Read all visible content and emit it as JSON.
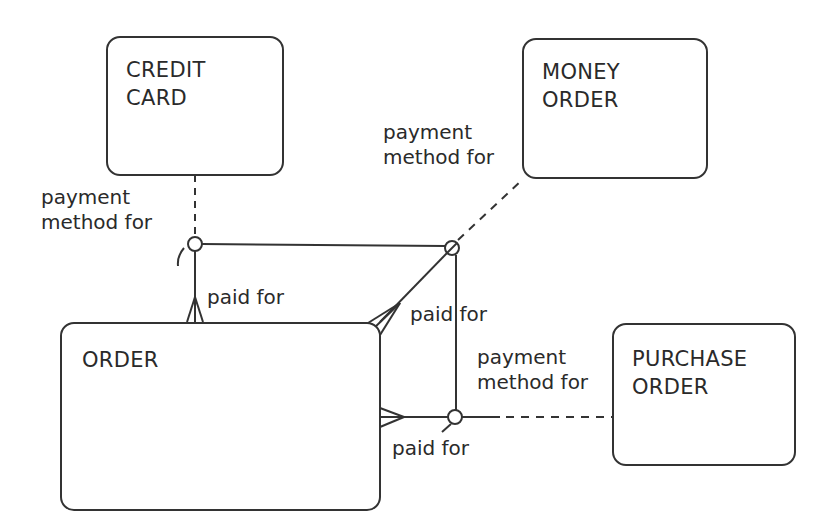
{
  "diagram": {
    "type": "entity-relationship",
    "entities": [
      {
        "id": "credit_card",
        "label": "CREDIT\nCARD"
      },
      {
        "id": "money_order",
        "label": "MONEY\nORDER"
      },
      {
        "id": "order",
        "label": "ORDER"
      },
      {
        "id": "purchase_order",
        "label": "PURCHASE\nORDER"
      }
    ],
    "relationships": [
      {
        "from": "credit_card",
        "to": "order",
        "from_label": "payment\nmethod for",
        "to_label": "paid for"
      },
      {
        "from": "money_order",
        "to": "order",
        "from_label": "payment\nmethod for",
        "to_label": "paid for"
      },
      {
        "from": "purchase_order",
        "to": "order",
        "from_label": "payment\nmethod for",
        "to_label": "paid for"
      }
    ],
    "labels": {
      "cc_payment": "payment\nmethod for",
      "cc_paid": "paid for",
      "mo_payment": "payment\nmethod for",
      "mo_paid": "paid for",
      "po_payment": "payment\nmethod for",
      "po_paid": "paid for"
    },
    "colors": {
      "line": "#333333",
      "background": "#ffffff"
    }
  }
}
